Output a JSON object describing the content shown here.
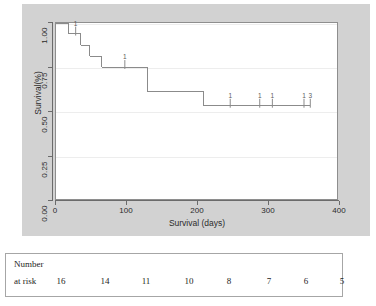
{
  "chart_data": {
    "type": "line",
    "subtype": "kaplan-meier-survival",
    "title": "",
    "xlabel": "Survival (days)",
    "ylabel": "Survival(%)",
    "xlim": [
      0,
      400
    ],
    "ylim": [
      0,
      1.0
    ],
    "grid": true,
    "legend": null,
    "xticks": [
      0,
      100,
      200,
      300,
      400
    ],
    "xtick_labels": [
      "0",
      "100",
      "200",
      "300",
      "400"
    ],
    "yticks": [
      0.0,
      0.25,
      0.5,
      0.75,
      1.0
    ],
    "ytick_labels": [
      "0.00",
      "0.25",
      "0.50",
      "0.75",
      "1.00"
    ],
    "step_points": [
      {
        "x": 0,
        "y": 1.0
      },
      {
        "x": 18,
        "y": 1.0
      },
      {
        "x": 18,
        "y": 0.94
      },
      {
        "x": 35,
        "y": 0.94
      },
      {
        "x": 35,
        "y": 0.875
      },
      {
        "x": 48,
        "y": 0.875
      },
      {
        "x": 48,
        "y": 0.81
      },
      {
        "x": 65,
        "y": 0.81
      },
      {
        "x": 65,
        "y": 0.75
      },
      {
        "x": 130,
        "y": 0.75
      },
      {
        "x": 130,
        "y": 0.61
      },
      {
        "x": 210,
        "y": 0.61
      },
      {
        "x": 210,
        "y": 0.53
      },
      {
        "x": 362,
        "y": 0.53
      }
    ],
    "censor_marks": [
      {
        "x": 28,
        "y": 0.94,
        "label": "1"
      },
      {
        "x": 98,
        "y": 0.75,
        "label": "1"
      },
      {
        "x": 248,
        "y": 0.53,
        "label": "1"
      },
      {
        "x": 290,
        "y": 0.53,
        "label": "1"
      },
      {
        "x": 308,
        "y": 0.53,
        "label": "1"
      },
      {
        "x": 353,
        "y": 0.53,
        "label": "1"
      },
      {
        "x": 362,
        "y": 0.53,
        "label": "3"
      }
    ]
  },
  "axes": {
    "x_title": "Survival (days)",
    "y_title": "Survival(%)",
    "x_labels": [
      "0",
      "100",
      "200",
      "300",
      "400"
    ],
    "y_labels": [
      "0.00",
      "0.25",
      "0.50",
      "0.75",
      "1.00"
    ]
  },
  "risk_table": {
    "row_label_line1": "Number",
    "row_label_line2": "at risk",
    "values": [
      "16",
      "14",
      "11",
      "10",
      "8",
      "7",
      "6",
      "5"
    ]
  },
  "colors": {
    "figure_background": "#d2d2d2",
    "panel_background": "#ffffff",
    "curve": "#8a8a8a",
    "axis": "#6b6b6b",
    "gridline": "#ededed",
    "text": "#2b2b2b",
    "table_border": "#a6a6a6"
  }
}
